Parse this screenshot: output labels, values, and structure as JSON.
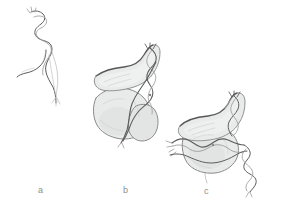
{
  "figure": {
    "background_color": "#ffffff",
    "style": "pencil-sketch scientific illustration",
    "width": 287,
    "height": 208,
    "panels": [
      {
        "id": "a",
        "label": "a",
        "label_x": 38,
        "label_y": 185,
        "caption_semantic": "free DNA double helix, unbound",
        "elements": [
          "dna-double-helix",
          "relaxed-strand-tail"
        ]
      },
      {
        "id": "b",
        "label": "b",
        "label_x": 123,
        "label_y": 185,
        "caption_semantic": "DNA wrapping around protein complex",
        "elements": [
          "protein-upper-lobe",
          "protein-lower-lobe",
          "protein-side-lobe",
          "dna-double-helix"
        ]
      },
      {
        "id": "c",
        "label": "c",
        "label_x": 204,
        "label_y": 186,
        "caption_semantic": "DNA threaded through protein complex with emerging helix",
        "elements": [
          "protein-upper-lobe",
          "protein-lower-lobe",
          "dna-horizontal-strand",
          "dna-double-helix-tail"
        ]
      }
    ],
    "colors": {
      "background": "#ffffff",
      "protein_fill": "#e9eaea",
      "protein_shade": "#dcdddd",
      "outline_dark": "#575757",
      "outline_mid": "#8b8c8c",
      "outline_soft": "#b4b5b5",
      "dna_dark": "#5c5c5c",
      "dna_light": "#c0c1c1",
      "label_text": "#8e8e8e"
    }
  }
}
